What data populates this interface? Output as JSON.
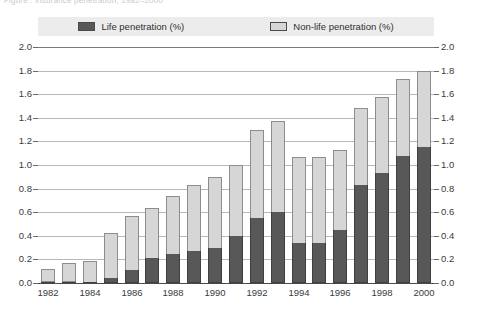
{
  "caption": {
    "clipped_text": "Figure   :    insurance penetration, 1982–2000"
  },
  "legend": {
    "items": [
      {
        "label": "Life penetration (%)",
        "color": "#585858",
        "key": "life"
      },
      {
        "label": "Non-life penetration (%)",
        "color": "#d6d6d6",
        "key": "nonlife"
      }
    ]
  },
  "axes": {
    "y_ticks": [
      "2.0",
      "1.8",
      "1.6",
      "1.4",
      "1.2",
      "1.0",
      "0.8",
      "0.6",
      "0.4",
      "0.2",
      "0.0"
    ],
    "x_ticks": [
      "1982",
      "1984",
      "1986",
      "1988",
      "1990",
      "1992",
      "1994",
      "1996",
      "1998",
      "2000"
    ]
  },
  "chart_data": {
    "type": "bar",
    "stacked": true,
    "title": "",
    "xlabel": "",
    "ylabel": "",
    "ylim": [
      0.0,
      2.0
    ],
    "ytick_step": 0.2,
    "grid": true,
    "legend_position": "top",
    "dual_y_axis": true,
    "categories": [
      "1982",
      "1983",
      "1984",
      "1985",
      "1986",
      "1987",
      "1988",
      "1989",
      "1990",
      "1991",
      "1992",
      "1993",
      "1994",
      "1995",
      "1996",
      "1997",
      "1998",
      "1999",
      "2000"
    ],
    "series": [
      {
        "name": "Life penetration (%)",
        "color": "#585858",
        "values": [
          0.0,
          0.0,
          0.01,
          0.04,
          0.11,
          0.21,
          0.25,
          0.27,
          0.3,
          0.4,
          0.55,
          0.6,
          0.34,
          0.34,
          0.45,
          0.83,
          0.93,
          1.08,
          1.15
        ]
      },
      {
        "name": "Non-life penetration (%)",
        "color": "#d6d6d6",
        "values": [
          0.11,
          0.16,
          0.18,
          0.38,
          0.46,
          0.43,
          0.49,
          0.56,
          0.6,
          0.6,
          0.75,
          0.77,
          0.73,
          0.73,
          0.68,
          0.65,
          0.65,
          0.65,
          0.65
        ]
      }
    ],
    "totals": [
      0.11,
      0.16,
      0.19,
      0.42,
      0.57,
      0.64,
      0.74,
      0.83,
      0.9,
      1.0,
      1.3,
      1.37,
      1.07,
      1.07,
      1.13,
      1.48,
      1.58,
      1.73,
      1.8
    ]
  }
}
